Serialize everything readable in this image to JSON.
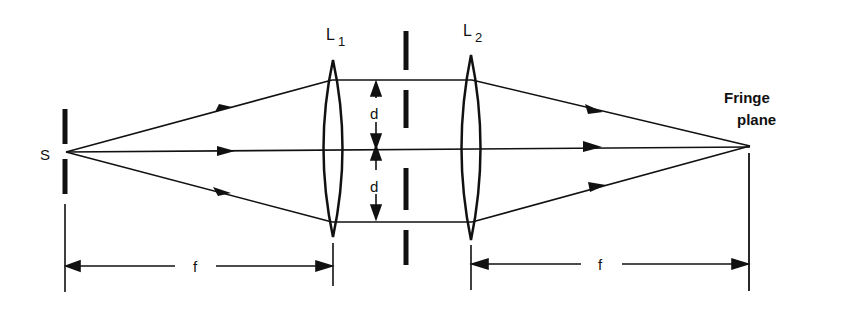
{
  "diagram": {
    "labels": {
      "source": "S",
      "lens1": "L",
      "lens1_sub": "1",
      "lens2": "L",
      "lens2_sub": "2",
      "slit_sep_top": "d",
      "slit_sep_bottom": "d",
      "fringe_plane_line1": "Fringe",
      "fringe_plane_line2": "plane",
      "focal_left": "f",
      "focal_right": "f"
    },
    "colors": {
      "ink": "#111111",
      "background": "#ffffff"
    }
  }
}
